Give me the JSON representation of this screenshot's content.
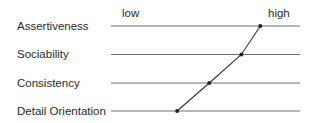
{
  "scale": {
    "low_label": "low",
    "high_label": "high"
  },
  "traits": [
    {
      "label": "Assertiveness",
      "value": 0.79
    },
    {
      "label": "Sociability",
      "value": 0.69
    },
    {
      "label": "Consistency",
      "value": 0.52
    },
    {
      "label": "Detail Orientation",
      "value": 0.35
    }
  ],
  "colors": {
    "text": "#2a2a2a",
    "line": "#6e6e6e",
    "profile": "#333333",
    "marker": "#222222"
  }
}
